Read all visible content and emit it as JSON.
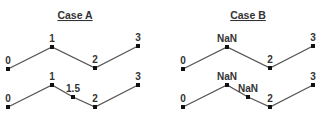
{
  "panels": [
    {
      "title": "Case A",
      "title_pos": [
        75,
        19
      ],
      "rows": [
        {
          "points": [
            {
              "label": "0",
              "x": 8,
              "y": 69
            },
            {
              "label": "1",
              "x": 52,
              "y": 47
            },
            {
              "label": "2",
              "x": 95,
              "y": 68
            },
            {
              "label": "3",
              "x": 138,
              "y": 46
            }
          ]
        },
        {
          "points": [
            {
              "label": "0",
              "x": 8,
              "y": 107
            },
            {
              "label": "1",
              "x": 52,
              "y": 85
            },
            {
              "label": "1.5",
              "x": 73,
              "y": 97
            },
            {
              "label": "2",
              "x": 95,
              "y": 107
            },
            {
              "label": "3",
              "x": 138,
              "y": 85
            }
          ]
        }
      ]
    },
    {
      "title": "Case B",
      "title_pos": [
        248,
        19
      ],
      "rows": [
        {
          "points": [
            {
              "label": "0",
              "x": 183,
              "y": 69
            },
            {
              "label": "NaN",
              "x": 227,
              "y": 47
            },
            {
              "label": "2",
              "x": 270,
              "y": 68
            },
            {
              "label": "3",
              "x": 313,
              "y": 46
            }
          ]
        },
        {
          "points": [
            {
              "label": "0",
              "x": 183,
              "y": 107
            },
            {
              "label": "NaN",
              "x": 227,
              "y": 85
            },
            {
              "label": "NaN",
              "x": 248,
              "y": 97
            },
            {
              "label": "2",
              "x": 270,
              "y": 107
            },
            {
              "label": "3",
              "x": 313,
              "y": 85
            }
          ]
        }
      ]
    }
  ]
}
